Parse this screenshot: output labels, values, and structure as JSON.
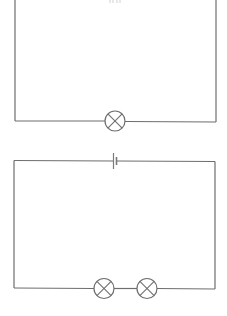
{
  "diagram": {
    "type": "circuit-schematic",
    "wire_color": "#6e6e6e",
    "background": "#ffffff",
    "circuits": [
      {
        "id": "circuit-1",
        "description": "Series circuit with one cell and one lamp",
        "components": [
          {
            "type": "cell",
            "count": 1,
            "position": "top (clipped)"
          },
          {
            "type": "lamp",
            "count": 1,
            "position": "bottom"
          }
        ]
      },
      {
        "id": "circuit-2",
        "description": "Series circuit with one cell and two lamps",
        "components": [
          {
            "type": "cell",
            "count": 1,
            "position": "top"
          },
          {
            "type": "lamp",
            "count": 2,
            "position": "bottom"
          }
        ]
      }
    ]
  }
}
